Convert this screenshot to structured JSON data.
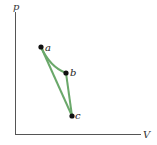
{
  "diagram": {
    "type": "pV-diagram",
    "axes": {
      "y_label": "p",
      "x_label": "V",
      "color": "#555555"
    },
    "path_color": "#6aa86a",
    "point_color": "#111111",
    "points": [
      {
        "label": "a",
        "x": 41,
        "y": 47
      },
      {
        "label": "b",
        "x": 66,
        "y": 73
      },
      {
        "label": "c",
        "x": 72,
        "y": 116
      }
    ],
    "segments": [
      {
        "from": "a",
        "to": "b",
        "shape": "curve"
      },
      {
        "from": "b",
        "to": "c",
        "shape": "straight"
      },
      {
        "from": "c",
        "to": "a",
        "shape": "straight"
      }
    ]
  }
}
